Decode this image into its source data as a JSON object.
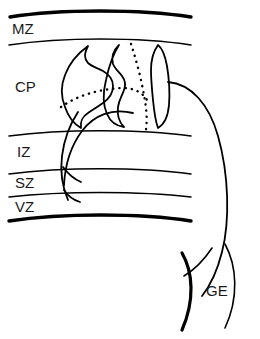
{
  "figure": {
    "background_color": "#ffffff",
    "stroke_color": "#000000",
    "width": 260,
    "height": 339
  },
  "zones": [
    {
      "id": "mz",
      "label": "MZ",
      "name": "marginal zone",
      "label_x": 12,
      "label_y": 30
    },
    {
      "id": "cp",
      "label": "CP",
      "name": "cortical plate",
      "label_x": 15,
      "label_y": 88
    },
    {
      "id": "iz",
      "label": "IZ",
      "name": "intermediate zone",
      "label_x": 17,
      "label_y": 153
    },
    {
      "id": "sz",
      "label": "SZ",
      "name": "subventricular zone",
      "label_x": 15,
      "label_y": 184
    },
    {
      "id": "vz",
      "label": "VZ",
      "name": "ventricular zone",
      "label_x": 15,
      "label_y": 208
    },
    {
      "id": "ge",
      "label": "GE",
      "name": "ganglionic eminence",
      "label_x": 206,
      "label_y": 292
    }
  ],
  "boundaries": [
    {
      "id": "pial-surface",
      "name": "pial-surface-boundary",
      "weight": "thick",
      "path": "M 10 17 C 60 9, 140 9, 191 17"
    },
    {
      "id": "mz-cp",
      "name": "mz-cp-boundary",
      "weight": "thin",
      "path": "M 9 45 C 62 37, 140 37, 191 45"
    },
    {
      "id": "cp-iz",
      "name": "cp-iz-boundary",
      "weight": "thin",
      "path": "M 9 136 C 62 129, 140 129, 191 136"
    },
    {
      "id": "iz-sz",
      "name": "iz-sz-boundary",
      "weight": "thin",
      "path": "M 9 174 C 62 167, 140 167, 191 174"
    },
    {
      "id": "sz-vz",
      "name": "sz-vz-boundary",
      "weight": "thin",
      "path": "M 9 197 C 62 191, 140 191, 191 197"
    },
    {
      "id": "ventricular-surface",
      "name": "ventricular-surface-boundary",
      "weight": "thick",
      "path": "M 9 221 C 62 213, 140 213, 191 221"
    }
  ],
  "cells": [
    {
      "id": "cell-left",
      "name": "pyramidal-neuron-left-soma",
      "path": "M 88 46 C 84 54, 84 58, 88 63 C 92 67, 96 67, 103 71 C 110 75, 113 80, 113 86 C 113 92, 110 98, 103 103 C 96 108, 92 110, 88 113 C 82 117, 80 121, 81 128 C 74 124, 68 116, 65 107 C 61 97, 61 85, 65 75 C 69 64, 77 54, 88 46 Z"
    },
    {
      "id": "cell-middle",
      "name": "pyramidal-neuron-middle-soma",
      "path": "M 119 45 C 113 51, 111 57, 113 64 C 115 69, 119 72, 122 76 C 125 80, 126 85, 124 90 C 122 96, 119 100, 118 107 C 117 115, 119 122, 124 127 C 116 126, 110 121, 107 114 C 103 105, 103 92, 106 80 C 109 66, 113 54, 119 45 Z"
    },
    {
      "id": "cell-right",
      "name": "pyramidal-neuron-right-soma",
      "path": "M 158 45 C 153 52, 151 60, 151 70 C 151 80, 152 90, 153 100 C 154 110, 155 120, 158 128 C 165 124, 168 116, 169 105 C 170 92, 169 78, 167 66 C 165 55, 162 48, 158 45 Z"
    }
  ],
  "fibers": [
    {
      "id": "radial-descending",
      "name": "radial-glial-descending-fiber",
      "style": "solid",
      "path": "M 78 112 C 70 124, 64 140, 62 156 C 60 172, 62 186, 68 200"
    },
    {
      "id": "migrating-arc",
      "name": "migrating-neuron-leading-process",
      "style": "solid",
      "path": "M 133 113 C 112 108, 94 115, 82 131 C 70 147, 65 166, 64 185"
    },
    {
      "id": "branch-upper",
      "name": "fiber-branch-upper",
      "style": "solid",
      "path": "M 63 167 C 68 174, 74 179, 81 182"
    },
    {
      "id": "branch-lower",
      "name": "fiber-branch-lower",
      "style": "solid",
      "path": "M 64 190 C 68 196, 73 200, 80 202"
    },
    {
      "id": "dotted-horizontal",
      "name": "tangential-migration-dotted-path",
      "style": "dotted",
      "path": "M 61 107 C 78 95, 100 89, 122 88 C 134 88, 142 92, 147 100"
    },
    {
      "id": "dotted-vertical",
      "name": "radial-migration-dotted-path",
      "style": "dotted",
      "path": "M 131 44 C 137 62, 142 82, 145 101 C 147 113, 147 123, 146 130"
    },
    {
      "id": "ge-to-cortex-arc",
      "name": "ge-to-cortex-migration-arc",
      "style": "solid",
      "path": "M 168 82 C 191 84, 209 104, 218 136 C 229 175, 230 221, 222 252 C 217 272, 210 286, 202 296"
    }
  ],
  "ge_arcs": [
    {
      "id": "ge-left",
      "name": "ge-left-boundary-arc",
      "weight": "thick",
      "path": "M 182 253 C 193 272, 195 300, 182 330"
    },
    {
      "id": "ge-right",
      "name": "ge-right-boundary-arc",
      "weight": "thin",
      "path": "M 225 244 C 237 266, 239 298, 225 328"
    },
    {
      "id": "ge-cross",
      "name": "ge-crossing-fiber",
      "weight": "thin",
      "path": "M 212 248 C 204 260, 194 270, 184 276"
    }
  ]
}
